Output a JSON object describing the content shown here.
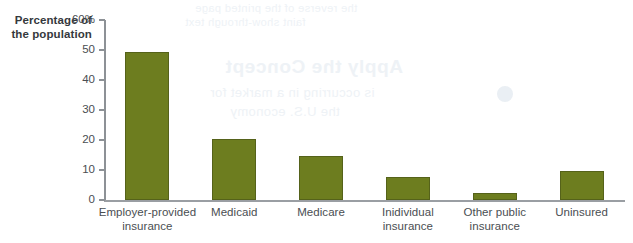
{
  "chart_data": {
    "type": "bar",
    "title": "",
    "subtitle": "",
    "xlabel": "",
    "ylabel": "Percentage\nof the\npopulation",
    "ylim": [
      0,
      60
    ],
    "ytick_values": [
      0,
      10,
      20,
      30,
      40,
      50,
      60
    ],
    "ytick_labels": [
      "0",
      "10",
      "20",
      "30",
      "40",
      "50",
      "60%"
    ],
    "grid": false,
    "legend": null,
    "bar_color": "#6d7d1f",
    "bar_edge_color": "#55621a",
    "axis_color": "#8d9196",
    "text_color": "#4a4e52",
    "categories": [
      "Employer-provided\ninsurance",
      "Medicaid",
      "Medicare",
      "Inidividual\ninsurance",
      "Other public\ninsurance",
      "Uninsured"
    ],
    "values": [
      49.3,
      20.3,
      14.7,
      7.6,
      2.3,
      9.7
    ]
  },
  "bleed_through": {
    "line_a": "the reverse of the printed page",
    "line_b": "faint show-through text",
    "line_c": "Apply the Concept",
    "line_d": "is occurring in a market for",
    "line_e": "the U.S. economy"
  }
}
